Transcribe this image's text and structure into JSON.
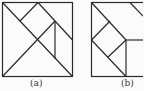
{
  "figures": [
    {
      "label": "(a)",
      "description": "Square divided into tangram-like pieces by diagonals"
    },
    {
      "label": "(b)",
      "description": "Square with rotated inner square and triangular pieces"
    }
  ],
  "colors": {
    "line": "#2a2a2a",
    "background": "#fbfbfb"
  }
}
